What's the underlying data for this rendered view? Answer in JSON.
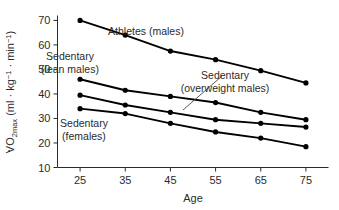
{
  "chart_data": {
    "type": "line",
    "title": "",
    "xlabel": "Age",
    "ylabel": "VO2max (ml · kg⁻¹ · min⁻¹)",
    "ylabel_parts": {
      "v_dot": "V",
      "o": "O",
      "subscript": "2max",
      "units": " (ml · kg",
      "exp1": "−1",
      "mid": " · min",
      "exp2": "−1",
      "close": ")"
    },
    "x": [
      25,
      35,
      45,
      55,
      65,
      75
    ],
    "xticklabels": [
      "25",
      "35",
      "45",
      "55",
      "65",
      "75"
    ],
    "yticks": [
      10,
      20,
      30,
      40,
      50,
      60,
      70
    ],
    "yticklabels": [
      "10",
      "20",
      "30",
      "40",
      "50",
      "60",
      "70"
    ],
    "xlim": [
      20,
      80
    ],
    "ylim": [
      10,
      72
    ],
    "grid": false,
    "legend": "inline-annotations",
    "marker": "filled-circle",
    "line_color": "#000000",
    "series": [
      {
        "name": "Athletes (males)",
        "label_line1": "Athletes (males)",
        "label_line2": "",
        "values": [
          70,
          64,
          57.5,
          54,
          49.5,
          44.5
        ]
      },
      {
        "name": "Sedentary (lean males)",
        "label_line1": "Sedentary",
        "label_line2": "(lean males)",
        "values": [
          46,
          41.5,
          39,
          36.5,
          32.5,
          29.5
        ]
      },
      {
        "name": "Sedentary (overweight males)",
        "label_line1": "Sedentary",
        "label_line2": "(overweight males)",
        "values": [
          39.5,
          35.5,
          32.5,
          29.5,
          28,
          26.5
        ]
      },
      {
        "name": "Sedentary (females)",
        "label_line1": "Sedentary",
        "label_line2": "(females)",
        "values": [
          34,
          32,
          28,
          24.5,
          22,
          18.5
        ]
      }
    ],
    "annotations": [
      {
        "name": "athletes-label",
        "text": "Athletes (males)",
        "x": 146,
        "y": 35
      },
      {
        "name": "lean-males-label-line1",
        "text": "Sedentary",
        "x": 70,
        "y": 60
      },
      {
        "name": "lean-males-label-line2",
        "text": "(lean males)",
        "x": 70,
        "y": 73
      },
      {
        "name": "overweight-males-label-line1",
        "text": "Sedentary",
        "x": 225,
        "y": 79
      },
      {
        "name": "overweight-males-label-line2",
        "text": "(overweight males)",
        "x": 225,
        "y": 92
      },
      {
        "name": "females-label-line1",
        "text": "Sedentary",
        "x": 84,
        "y": 127
      },
      {
        "name": "females-label-line2",
        "text": "(females)",
        "x": 84,
        "y": 140
      }
    ],
    "leader_line": {
      "name": "overweight-leader-line",
      "x1": 222,
      "y1": 76,
      "x2": 183,
      "y2": 110
    }
  }
}
